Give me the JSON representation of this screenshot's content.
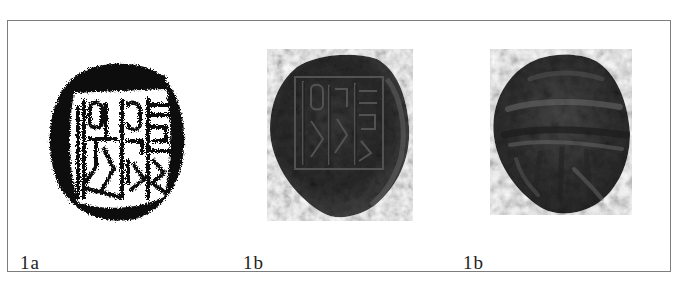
{
  "figure": {
    "panels": [
      {
        "id": "1a",
        "label": "1a",
        "kind": "ink-rubbing",
        "description": "Black-and-white ink rubbing of a seal impression showing seal-script characters in a rectangular frame"
      },
      {
        "id": "1b-obverse",
        "label": "1b",
        "kind": "photograph",
        "description": "Photograph of a dark clay sealing, face bearing the impressed seal-script characters"
      },
      {
        "id": "1b-reverse",
        "label": "1b",
        "kind": "photograph",
        "description": "Photograph of the reverse of the dark clay sealing, showing cord/string marks"
      }
    ]
  },
  "colors": {
    "frame_border": "#7d7d7d",
    "rubbing_ink": "#0b0b0b",
    "clay_dark": "#2e2e2e",
    "clay_mid": "#4a4a4a",
    "clay_light": "#6e6e6e",
    "label_text": "#222222"
  }
}
